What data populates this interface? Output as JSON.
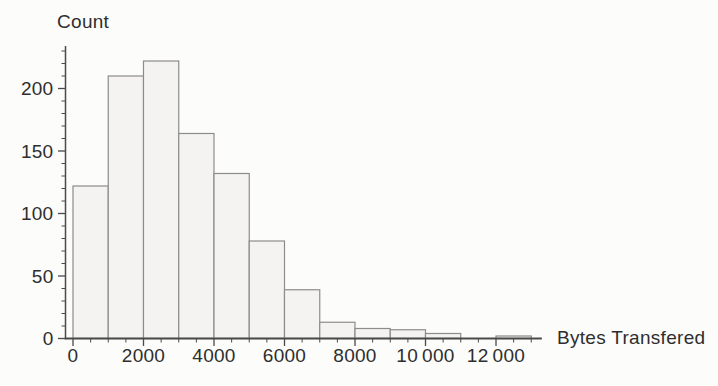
{
  "figure": {
    "background": "#fcfcfa",
    "colors": {
      "bar_fill": "#f4f3f1",
      "bar_stroke": "#8c8c8c",
      "axis": "#4a4a4a",
      "text": "#2e2e2e"
    }
  },
  "chart_data": {
    "type": "bar",
    "title": "",
    "ylabel": "Count",
    "xlabel": "Bytes Transfered",
    "grid": false,
    "legend": null,
    "bin_width": 1000,
    "bin_edges": [
      0,
      1000,
      2000,
      3000,
      4000,
      5000,
      6000,
      7000,
      8000,
      9000,
      10000,
      11000,
      12000,
      13000
    ],
    "values": [
      122,
      210,
      222,
      164,
      132,
      78,
      39,
      13,
      8,
      7,
      4,
      0,
      2
    ],
    "x_tick_values": [
      0,
      2000,
      4000,
      6000,
      8000,
      10000,
      12000
    ],
    "x_tick_labels": [
      "0",
      "2000",
      "4000",
      "6000",
      "8000",
      "10 000",
      "12 000"
    ],
    "x_minor_tick_step": 500,
    "y_tick_values": [
      0,
      50,
      100,
      150,
      200
    ],
    "y_tick_labels": [
      "0",
      "50",
      "100",
      "150",
      "200"
    ],
    "y_minor_tick_step": 10,
    "xlim": [
      0,
      13300
    ],
    "ylim": [
      0,
      234
    ]
  }
}
